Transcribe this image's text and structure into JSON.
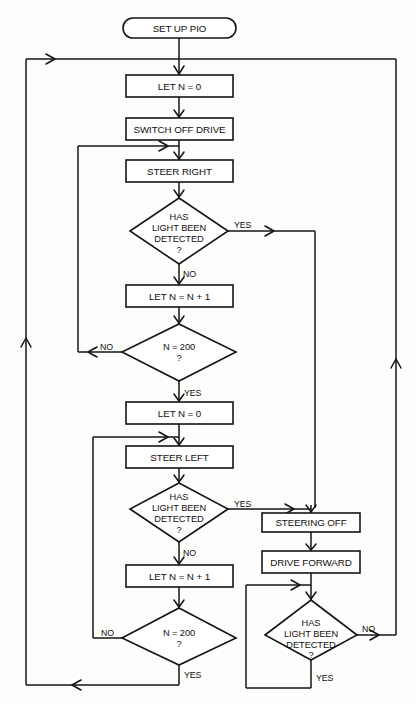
{
  "diagram": {
    "type": "flowchart",
    "colors": {
      "stroke": "#141414",
      "fill": "#ffffff",
      "background": "#fdfdfc",
      "text": "#111111"
    },
    "nodes": [
      {
        "id": "start",
        "kind": "terminator",
        "label": "SET UP PIO"
      },
      {
        "id": "let_n_0_a",
        "kind": "process",
        "label": "LET N = 0"
      },
      {
        "id": "switch_off",
        "kind": "process",
        "label": "SWITCH OFF DRIVE"
      },
      {
        "id": "steer_right",
        "kind": "process",
        "label": "STEER RIGHT"
      },
      {
        "id": "light_q_a",
        "kind": "decision",
        "line1": "HAS",
        "line2": "LIGHT BEEN",
        "line3": "DETECTED",
        "line4": "?"
      },
      {
        "id": "inc_n_a",
        "kind": "process",
        "label": "LET N = N + 1"
      },
      {
        "id": "n200_a",
        "kind": "decision",
        "line1": "N = 200",
        "line2": "?"
      },
      {
        "id": "let_n_0_b",
        "kind": "process",
        "label": "LET N = 0"
      },
      {
        "id": "steer_left",
        "kind": "process",
        "label": "STEER LEFT"
      },
      {
        "id": "light_q_b",
        "kind": "decision",
        "line1": "HAS",
        "line2": "LIGHT BEEN",
        "line3": "DETECTED",
        "line4": "?"
      },
      {
        "id": "inc_n_b",
        "kind": "process",
        "label": "LET N = N + 1"
      },
      {
        "id": "n200_b",
        "kind": "decision",
        "line1": "N = 200",
        "line2": "?"
      },
      {
        "id": "steering_off",
        "kind": "process",
        "label": "STEERING OFF"
      },
      {
        "id": "drive_fwd",
        "kind": "process",
        "label": "DRIVE FORWARD"
      },
      {
        "id": "light_q_c",
        "kind": "decision",
        "line1": "HAS",
        "line2": "LIGHT BEEN",
        "line3": "DETECTED",
        "line4": "?"
      }
    ],
    "edge_labels": {
      "yes_light_a": "YES",
      "no_light_a": "NO",
      "no_n200_a": "NO",
      "yes_n200_a": "YES",
      "yes_light_b": "YES",
      "no_light_b": "NO",
      "no_n200_b": "NO",
      "yes_n200_b": "YES",
      "no_light_c": "NO",
      "yes_light_c": "YES"
    }
  }
}
